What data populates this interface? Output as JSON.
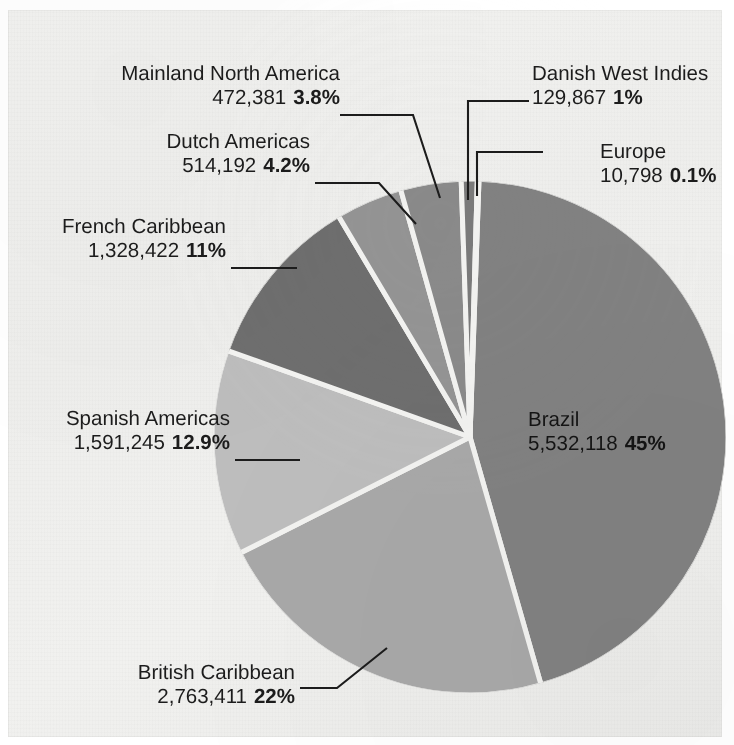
{
  "chart_data": {
    "type": "pie",
    "title": "",
    "total": 12342434,
    "unit": "people",
    "start_angle_deg": 2,
    "direction": "clockwise",
    "categories": [
      "Brazil",
      "British Caribbean",
      "Spanish Americas",
      "French Caribbean",
      "Dutch Americas",
      "Mainland North America",
      "Danish West Indies",
      "Europe"
    ],
    "values": [
      5532118,
      2763411,
      1591245,
      1328422,
      514192,
      472381,
      129867,
      10798
    ],
    "value_labels": [
      "5,532,118",
      "2,763,411",
      "1,591,245",
      "1,328,422",
      "514,192",
      "472,381",
      "129,867",
      "10,798"
    ],
    "percent_labels": [
      "45%",
      "22%",
      "12.9%",
      "11%",
      "4.2%",
      "3.8%",
      "1%",
      "0.1%"
    ],
    "percents": [
      45,
      22,
      12.9,
      11,
      4.2,
      3.8,
      1,
      0.1
    ],
    "colors": [
      "#818181",
      "#a8a8a8",
      "#bdbdbd",
      "#6e6e6e",
      "#949494",
      "#8a8a8a",
      "#7a7a7a",
      "#888888"
    ],
    "slice_gap_color": "#f2f2f0",
    "legend": "none",
    "grid": false
  },
  "slices": {
    "brazil": {
      "name": "Brazil",
      "value": "5,532,118",
      "pct": "45%"
    },
    "british": {
      "name": "British Caribbean",
      "value": "2,763,411",
      "pct": "22%"
    },
    "spanish": {
      "name": "Spanish Americas",
      "value": "1,591,245",
      "pct": "12.9%"
    },
    "french": {
      "name": "French Caribbean",
      "value": "1,328,422",
      "pct": "11%"
    },
    "dutch": {
      "name": "Dutch Americas",
      "value": "514,192",
      "pct": "4.2%"
    },
    "mainland": {
      "name": "Mainland North America",
      "value": "472,381",
      "pct": "3.8%"
    },
    "danish": {
      "name": "Danish West Indies",
      "value": "129,867",
      "pct": "1%"
    },
    "europe": {
      "name": "Europe",
      "value": "10,798",
      "pct": "0.1%"
    }
  },
  "page": {
    "background_color": "#f1f1ef",
    "text_color": "#1c1c1c",
    "bleed_top_right": "",
    "bleed_top_left": "",
    "bleed_bottom_right": ""
  }
}
